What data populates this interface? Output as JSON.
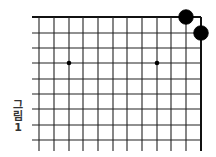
{
  "figure": {
    "caption_chars": [
      "그",
      "림",
      "1"
    ],
    "caption_text": "그림 1"
  },
  "board": {
    "line_color": "#222222",
    "edge_color": "#111111",
    "stone_color": "#000000",
    "visible_columns": 12,
    "visible_rows": 9,
    "col_x": [
      39,
      54,
      69,
      83,
      98,
      113,
      127,
      142,
      157,
      171,
      186,
      201
    ],
    "row_y": [
      17,
      33,
      48,
      63,
      79,
      94,
      109,
      125,
      140
    ],
    "line_left_start": 32,
    "line_bottom_end": 151,
    "edges": [
      "top",
      "right"
    ],
    "star_points": [
      {
        "col": 2,
        "row": 3
      },
      {
        "col": 8,
        "row": 3
      }
    ],
    "stones": [
      {
        "color": "black",
        "col": 10,
        "row": 0
      },
      {
        "color": "black",
        "col": 11,
        "row": 1
      }
    ]
  }
}
